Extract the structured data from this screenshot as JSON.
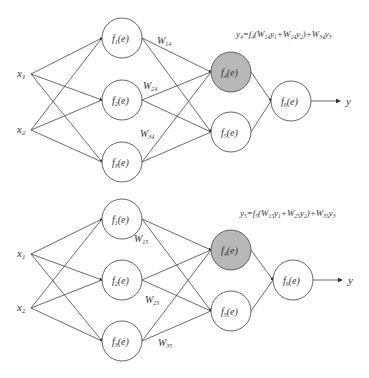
{
  "diagrams": [
    {
      "id": "top",
      "formula": {
        "lhs": "y",
        "lhs_sub": "4",
        "text": "y4=f4(W14y1+W24y2)+W34y3",
        "parts": [
          "=",
          "f",
          "4",
          "(",
          "W",
          "14",
          "y",
          "1",
          "+",
          "W",
          "24",
          "y",
          "2",
          ")+",
          "W",
          "34",
          "y",
          "3"
        ]
      },
      "inputs": [
        {
          "label": "x",
          "sub": "1"
        },
        {
          "label": "x",
          "sub": "2"
        }
      ],
      "hidden1": [
        {
          "label": "f",
          "sub": "1",
          "arg": "(e)"
        },
        {
          "label": "f",
          "sub": "2",
          "arg": "(e)"
        },
        {
          "label": "f",
          "sub": "3",
          "arg": "(e)"
        }
      ],
      "hidden2": [
        {
          "label": "f",
          "sub": "4",
          "arg": "(e)",
          "highlighted": true
        },
        {
          "label": "f",
          "sub": "5",
          "arg": "(e)",
          "highlighted": false
        }
      ],
      "output_node": {
        "label": "f",
        "sub": "6",
        "arg": "(e)"
      },
      "output": "y",
      "weights": [
        {
          "label": "W",
          "sub": "14"
        },
        {
          "label": "W",
          "sub": "24"
        },
        {
          "label": "W",
          "sub": "34"
        }
      ]
    },
    {
      "id": "bottom",
      "formula": {
        "lhs": "y",
        "lhs_sub": "5",
        "text": "y5=f5(W15y1+W25y2)+W35y3",
        "parts": [
          "=",
          "f",
          "5",
          "(",
          "W",
          "15",
          "y",
          "1",
          "+",
          "W",
          "25",
          "y",
          "2",
          ")+",
          "W",
          "35",
          "y",
          "3"
        ]
      },
      "inputs": [
        {
          "label": "x",
          "sub": "1"
        },
        {
          "label": "x",
          "sub": "2"
        }
      ],
      "hidden1": [
        {
          "label": "f",
          "sub": "1",
          "arg": "(e)"
        },
        {
          "label": "f",
          "sub": "2",
          "arg": "(e)"
        },
        {
          "label": "f",
          "sub": "3",
          "arg": "(e)"
        }
      ],
      "hidden2": [
        {
          "label": "f",
          "sub": "4",
          "arg": "(e)",
          "highlighted": true
        },
        {
          "label": "f",
          "sub": "5",
          "arg": "(e)",
          "highlighted": false
        }
      ],
      "output_node": {
        "label": "f",
        "sub": "6",
        "arg": "(e)"
      },
      "output": "y",
      "weights": [
        {
          "label": "W",
          "sub": "15"
        },
        {
          "label": "W",
          "sub": "25"
        },
        {
          "label": "W",
          "sub": "35"
        }
      ]
    }
  ],
  "colors": {
    "highlight_fill": "#b8b8b8",
    "node_fill": "#ffffff",
    "line": "#444444"
  }
}
